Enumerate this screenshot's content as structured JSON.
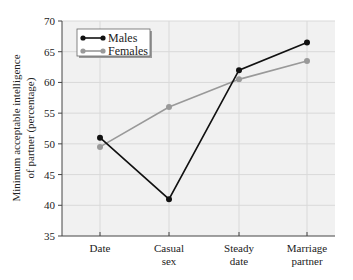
{
  "chart_data": {
    "type": "line",
    "title": "",
    "xlabel": "",
    "ylabel": "Minimum acceptable intelligence of partner (percentage)",
    "ylabel_lines": [
      "Minimum acceptable intelligence",
      "of partner (percentage)"
    ],
    "categories": [
      "Date",
      "Casual sex",
      "Steady date",
      "Marriage partner"
    ],
    "category_lines": [
      [
        "Date"
      ],
      [
        "Casual",
        "sex"
      ],
      [
        "Steady",
        "date"
      ],
      [
        "Marriage",
        "partner"
      ]
    ],
    "series": [
      {
        "name": "Males",
        "color": "#111111",
        "values": [
          51,
          41,
          62,
          66.5
        ]
      },
      {
        "name": "Females",
        "color": "#999999",
        "values": [
          49.5,
          56,
          60.5,
          63.5
        ]
      }
    ],
    "ylim": [
      35,
      70
    ],
    "yticks": [
      35,
      40,
      45,
      50,
      55,
      60,
      65,
      70
    ],
    "grid": true,
    "legend_position": "upper left",
    "background": "#f1f1f1",
    "gridline_color": "#d9d9d9"
  }
}
